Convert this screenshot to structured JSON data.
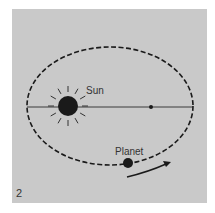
{
  "figure": {
    "number": "2",
    "labels": {
      "sun": "Sun",
      "planet": "Planet"
    },
    "colors": {
      "background": "#c9c9c9",
      "ink": "#1a1a1a",
      "axis": "#3a3a3a"
    }
  }
}
